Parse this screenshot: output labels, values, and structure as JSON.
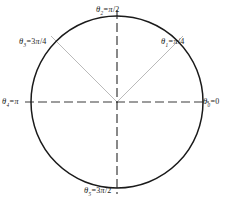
{
  "figure": {
    "name": "unit-circle-angle-diagram",
    "type": "unit-circle",
    "colors": {
      "circle_stroke": "#1a1a1a",
      "axis_stroke": "#3a3a3a",
      "diagonal_stroke": "#a8a8a8",
      "background": "#ffffff",
      "text": "#1a1a1a"
    },
    "geometry": {
      "center_x": 117,
      "center_y": 102,
      "radius": 86,
      "circle_stroke_width": 1.5,
      "axis_stroke_width": 1.2,
      "diagonal_stroke_width": 0.7,
      "axis_dash": "9 4",
      "diagonal_overshoot": 8
    }
  },
  "labels": {
    "theta_0": {
      "symbol": "θ",
      "subscript": "0",
      "equals": "=",
      "value": "0",
      "full": "θ₀=0",
      "angle_deg": 0,
      "angle_rad": "0"
    },
    "theta_1": {
      "symbol": "θ",
      "subscript": "1",
      "equals": "=",
      "numerator": "",
      "pi": "π",
      "denominator": "/4",
      "full": "θ₁=π/4",
      "angle_deg": 45,
      "angle_rad": "π/4"
    },
    "theta_2": {
      "symbol": "θ",
      "subscript": "2",
      "equals": "=",
      "numerator": "",
      "pi": "π",
      "denominator": "/2",
      "full": "θ₂=π/2",
      "angle_deg": 90,
      "angle_rad": "π/2"
    },
    "theta_3": {
      "symbol": "θ",
      "subscript": "3",
      "equals": "=",
      "numerator": "3",
      "pi": "π",
      "denominator": "/4",
      "full": "θ₃=3π/4",
      "angle_deg": 135,
      "angle_rad": "3π/4"
    },
    "theta_4": {
      "symbol": "θ",
      "subscript": "4",
      "equals": "=",
      "numerator": "",
      "pi": "π",
      "denominator": "",
      "full": "θ₄=π",
      "angle_deg": 180,
      "angle_rad": "π"
    },
    "theta_5": {
      "symbol": "θ",
      "subscript": "5",
      "equals": "=",
      "numerator": "3",
      "pi": "π",
      "denominator": "/2",
      "full": "θ₅=3π/2",
      "angle_deg": 270,
      "angle_rad": "3π/2"
    }
  }
}
